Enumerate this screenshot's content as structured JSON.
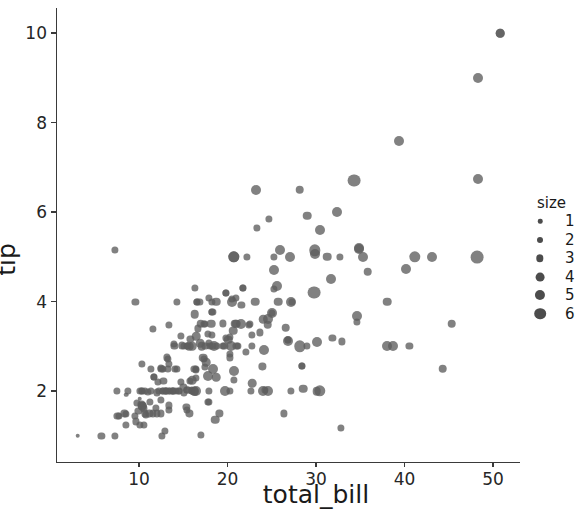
{
  "chart_data": {
    "type": "scatter",
    "title": "",
    "xlabel": "total_bill",
    "ylabel": "tip",
    "xlim": [
      2.5,
      54.0
    ],
    "ylim": [
      0.65,
      10.3
    ],
    "xticks": [
      10,
      20,
      30,
      40,
      50
    ],
    "yticks": [
      2,
      4,
      6,
      8,
      10
    ],
    "xticklabels": [
      "10",
      "20",
      "30",
      "40",
      "50"
    ],
    "yticklabels": [
      "2",
      "4",
      "6",
      "8",
      "10"
    ],
    "grid": false,
    "marker_color": "#5e5e5e",
    "marker_opacity": 0.78,
    "size_encoding": "size",
    "legend": {
      "position": "right",
      "title": "size",
      "entries": [
        {
          "label": "1",
          "diameter_px": 4.5
        },
        {
          "label": "2",
          "diameter_px": 6.0
        },
        {
          "label": "3",
          "diameter_px": 7.4
        },
        {
          "label": "4",
          "diameter_px": 8.8
        },
        {
          "label": "5",
          "diameter_px": 10.1
        },
        {
          "label": "6",
          "diameter_px": 11.6
        }
      ]
    },
    "points": [
      [
        16.99,
        1.01,
        2
      ],
      [
        10.34,
        1.66,
        3
      ],
      [
        21.01,
        3.5,
        3
      ],
      [
        23.68,
        3.31,
        2
      ],
      [
        24.59,
        3.61,
        4
      ],
      [
        25.29,
        4.71,
        4
      ],
      [
        8.77,
        2.0,
        2
      ],
      [
        26.88,
        3.12,
        4
      ],
      [
        15.04,
        1.96,
        2
      ],
      [
        14.78,
        3.23,
        2
      ],
      [
        10.27,
        1.71,
        2
      ],
      [
        35.26,
        5.0,
        4
      ],
      [
        15.42,
        1.57,
        2
      ],
      [
        18.43,
        3.0,
        4
      ],
      [
        14.83,
        3.02,
        2
      ],
      [
        21.58,
        3.92,
        2
      ],
      [
        10.33,
        1.67,
        3
      ],
      [
        16.29,
        3.71,
        3
      ],
      [
        16.97,
        3.5,
        3
      ],
      [
        20.65,
        3.35,
        3
      ],
      [
        17.92,
        4.08,
        2
      ],
      [
        20.29,
        2.75,
        2
      ],
      [
        15.77,
        2.23,
        2
      ],
      [
        39.42,
        7.58,
        4
      ],
      [
        19.82,
        3.18,
        2
      ],
      [
        17.81,
        2.34,
        4
      ],
      [
        13.37,
        2.0,
        2
      ],
      [
        12.69,
        2.0,
        2
      ],
      [
        21.7,
        4.3,
        2
      ],
      [
        19.65,
        3.0,
        2
      ],
      [
        9.55,
        1.45,
        2
      ],
      [
        18.35,
        2.5,
        4
      ],
      [
        15.06,
        3.0,
        2
      ],
      [
        20.69,
        2.45,
        4
      ],
      [
        17.78,
        3.27,
        2
      ],
      [
        24.06,
        3.6,
        3
      ],
      [
        16.31,
        2.0,
        3
      ],
      [
        16.93,
        3.07,
        3
      ],
      [
        18.69,
        2.31,
        3
      ],
      [
        31.27,
        5.0,
        3
      ],
      [
        16.04,
        2.24,
        3
      ],
      [
        17.46,
        2.54,
        2
      ],
      [
        13.94,
        3.06,
        2
      ],
      [
        9.68,
        1.32,
        2
      ],
      [
        30.4,
        5.6,
        4
      ],
      [
        18.29,
        3.0,
        2
      ],
      [
        22.23,
        5.0,
        2
      ],
      [
        32.4,
        6.0,
        4
      ],
      [
        28.55,
        2.05,
        3
      ],
      [
        18.04,
        3.0,
        2
      ],
      [
        12.54,
        2.5,
        2
      ],
      [
        10.29,
        2.6,
        2
      ],
      [
        34.81,
        5.2,
        4
      ],
      [
        9.94,
        1.56,
        2
      ],
      [
        25.56,
        4.34,
        4
      ],
      [
        19.49,
        3.51,
        2
      ],
      [
        38.01,
        3.0,
        4
      ],
      [
        26.41,
        1.5,
        2
      ],
      [
        11.24,
        1.76,
        2
      ],
      [
        48.27,
        6.73,
        4
      ],
      [
        20.29,
        3.21,
        2
      ],
      [
        13.81,
        2.0,
        2
      ],
      [
        11.02,
        1.98,
        2
      ],
      [
        18.29,
        3.76,
        2
      ],
      [
        17.59,
        2.64,
        3
      ],
      [
        20.08,
        3.15,
        3
      ],
      [
        16.45,
        2.47,
        2
      ],
      [
        3.07,
        1.0,
        1
      ],
      [
        20.23,
        2.01,
        2
      ],
      [
        15.01,
        2.09,
        2
      ],
      [
        12.02,
        1.97,
        2
      ],
      [
        17.07,
        3.0,
        3
      ],
      [
        26.86,
        3.14,
        2
      ],
      [
        25.28,
        5.0,
        2
      ],
      [
        14.73,
        2.2,
        2
      ],
      [
        10.51,
        1.25,
        2
      ],
      [
        17.92,
        3.08,
        2
      ],
      [
        27.2,
        4.0,
        4
      ],
      [
        22.76,
        3.0,
        2
      ],
      [
        17.29,
        2.71,
        2
      ],
      [
        19.44,
        3.0,
        2
      ],
      [
        16.66,
        3.4,
        2
      ],
      [
        10.07,
        1.83,
        1
      ],
      [
        32.68,
        5.0,
        2
      ],
      [
        15.98,
        2.03,
        2
      ],
      [
        34.83,
        5.17,
        4
      ],
      [
        13.03,
        2.0,
        2
      ],
      [
        18.28,
        4.0,
        2
      ],
      [
        24.71,
        5.85,
        2
      ],
      [
        21.16,
        3.0,
        2
      ],
      [
        28.97,
        3.0,
        2
      ],
      [
        22.49,
        3.5,
        2
      ],
      [
        5.75,
        1.0,
        2
      ],
      [
        16.32,
        4.3,
        2
      ],
      [
        22.75,
        3.25,
        2
      ],
      [
        40.17,
        4.73,
        4
      ],
      [
        27.28,
        4.0,
        2
      ],
      [
        12.03,
        1.5,
        2
      ],
      [
        21.01,
        3.0,
        2
      ],
      [
        12.46,
        1.5,
        2
      ],
      [
        11.35,
        2.5,
        2
      ],
      [
        15.38,
        3.0,
        2
      ],
      [
        44.3,
        2.5,
        3
      ],
      [
        22.42,
        3.48,
        2
      ],
      [
        20.92,
        4.08,
        2
      ],
      [
        15.36,
        1.64,
        2
      ],
      [
        20.49,
        4.06,
        2
      ],
      [
        25.21,
        4.29,
        2
      ],
      [
        18.24,
        3.76,
        2
      ],
      [
        14.31,
        4.0,
        2
      ],
      [
        14.0,
        3.0,
        2
      ],
      [
        7.25,
        1.0,
        2
      ],
      [
        38.07,
        4.0,
        3
      ],
      [
        23.95,
        2.55,
        2
      ],
      [
        25.71,
        4.0,
        3
      ],
      [
        17.31,
        3.5,
        2
      ],
      [
        29.93,
        5.07,
        4
      ],
      [
        10.65,
        1.5,
        2
      ],
      [
        12.43,
        1.8,
        2
      ],
      [
        24.08,
        2.92,
        4
      ],
      [
        11.69,
        2.31,
        2
      ],
      [
        13.42,
        1.68,
        2
      ],
      [
        14.26,
        2.5,
        2
      ],
      [
        15.95,
        2.0,
        2
      ],
      [
        12.48,
        2.52,
        2
      ],
      [
        29.8,
        4.2,
        6
      ],
      [
        8.52,
        1.48,
        2
      ],
      [
        14.52,
        2.0,
        2
      ],
      [
        11.38,
        2.0,
        2
      ],
      [
        22.82,
        2.18,
        3
      ],
      [
        19.08,
        1.5,
        2
      ],
      [
        20.27,
        2.83,
        2
      ],
      [
        11.17,
        1.5,
        2
      ],
      [
        12.26,
        2.0,
        2
      ],
      [
        18.26,
        3.25,
        2
      ],
      [
        8.51,
        1.25,
        2
      ],
      [
        10.33,
        2.0,
        2
      ],
      [
        14.15,
        2.0,
        2
      ],
      [
        16.0,
        2.0,
        2
      ],
      [
        13.16,
        2.75,
        2
      ],
      [
        17.47,
        3.5,
        2
      ],
      [
        34.3,
        6.7,
        6
      ],
      [
        41.19,
        5.0,
        5
      ],
      [
        27.05,
        5.0,
        4
      ],
      [
        16.43,
        2.3,
        2
      ],
      [
        8.35,
        1.5,
        2
      ],
      [
        18.64,
        1.36,
        3
      ],
      [
        11.87,
        1.63,
        2
      ],
      [
        19.81,
        4.19,
        2
      ],
      [
        28.44,
        2.56,
        2
      ],
      [
        15.48,
        2.02,
        2
      ],
      [
        16.58,
        4.0,
        2
      ],
      [
        7.56,
        1.44,
        2
      ],
      [
        10.34,
        2.0,
        2
      ],
      [
        43.11,
        5.0,
        4
      ],
      [
        13.0,
        2.0,
        2
      ],
      [
        13.51,
        2.0,
        2
      ],
      [
        18.71,
        4.0,
        3
      ],
      [
        12.74,
        2.01,
        2
      ],
      [
        13.0,
        2.0,
        2
      ],
      [
        16.4,
        2.5,
        2
      ],
      [
        20.53,
        4.0,
        4
      ],
      [
        16.47,
        3.23,
        3
      ],
      [
        26.59,
        3.41,
        3
      ],
      [
        38.73,
        3.0,
        4
      ],
      [
        24.27,
        2.03,
        2
      ],
      [
        12.76,
        2.23,
        2
      ],
      [
        30.06,
        2.0,
        3
      ],
      [
        25.89,
        5.16,
        4
      ],
      [
        48.33,
        9.0,
        4
      ],
      [
        13.27,
        2.5,
        2
      ],
      [
        28.17,
        6.5,
        3
      ],
      [
        12.9,
        1.1,
        2
      ],
      [
        28.15,
        3.0,
        5
      ],
      [
        11.59,
        1.5,
        2
      ],
      [
        7.74,
        1.44,
        2
      ],
      [
        30.14,
        3.09,
        4
      ],
      [
        12.16,
        2.2,
        2
      ],
      [
        13.42,
        3.48,
        2
      ],
      [
        8.58,
        1.92,
        1
      ],
      [
        15.98,
        3.0,
        3
      ],
      [
        13.42,
        1.58,
        2
      ],
      [
        16.27,
        2.5,
        2
      ],
      [
        10.09,
        2.0,
        2
      ],
      [
        20.45,
        3.0,
        4
      ],
      [
        13.28,
        2.72,
        2
      ],
      [
        22.12,
        2.88,
        2
      ],
      [
        24.01,
        2.0,
        4
      ],
      [
        15.69,
        3.0,
        3
      ],
      [
        11.61,
        3.39,
        2
      ],
      [
        10.77,
        1.47,
        2
      ],
      [
        15.53,
        3.0,
        2
      ],
      [
        10.07,
        1.25,
        2
      ],
      [
        12.6,
        1.0,
        2
      ],
      [
        32.83,
        1.17,
        2
      ],
      [
        35.83,
        4.67,
        3
      ],
      [
        29.03,
        5.92,
        3
      ],
      [
        27.18,
        2.0,
        2
      ],
      [
        22.67,
        2.0,
        2
      ],
      [
        17.82,
        1.75,
        2
      ],
      [
        18.78,
        3.0,
        2
      ],
      [
        20.69,
        5.0,
        5
      ],
      [
        9.78,
        1.73,
        2
      ],
      [
        14.07,
        2.5,
        2
      ],
      [
        7.51,
        2.0,
        2
      ],
      [
        26.86,
        3.14,
        2
      ],
      [
        25.0,
        3.75,
        2
      ],
      [
        21.7,
        4.3,
        2
      ],
      [
        50.81,
        10.0,
        3
      ],
      [
        17.92,
        1.75,
        2
      ],
      [
        13.81,
        2.0,
        2
      ],
      [
        11.69,
        2.31,
        2
      ],
      [
        17.26,
        2.74,
        3
      ],
      [
        24.55,
        2.0,
        4
      ],
      [
        19.77,
        2.0,
        4
      ],
      [
        29.85,
        5.14,
        5
      ],
      [
        48.17,
        5.0,
        6
      ],
      [
        25.0,
        3.75,
        4
      ],
      [
        13.39,
        2.61,
        2
      ],
      [
        16.49,
        2.0,
        4
      ],
      [
        21.5,
        3.5,
        4
      ],
      [
        12.66,
        2.5,
        2
      ],
      [
        16.21,
        2.0,
        3
      ],
      [
        13.81,
        2.0,
        2
      ],
      [
        17.51,
        3.0,
        2
      ],
      [
        24.52,
        3.48,
        3
      ],
      [
        20.76,
        2.24,
        2
      ],
      [
        31.71,
        4.5,
        4
      ],
      [
        10.59,
        1.61,
        2
      ],
      [
        10.63,
        2.0,
        2
      ],
      [
        50.81,
        10.0,
        3
      ],
      [
        15.81,
        3.16,
        2
      ],
      [
        7.25,
        5.15,
        2
      ],
      [
        31.85,
        3.18,
        2
      ],
      [
        16.82,
        4.0,
        2
      ],
      [
        32.9,
        3.11,
        2
      ],
      [
        17.89,
        2.0,
        2
      ],
      [
        14.48,
        2.0,
        2
      ],
      [
        9.6,
        4.0,
        2
      ],
      [
        34.63,
        3.55,
        2
      ],
      [
        34.65,
        3.68,
        4
      ],
      [
        23.33,
        5.65,
        2
      ],
      [
        45.35,
        3.5,
        3
      ],
      [
        23.17,
        6.5,
        4
      ],
      [
        40.55,
        3.0,
        2
      ],
      [
        20.69,
        5.0,
        5
      ],
      [
        20.9,
        3.5,
        3
      ],
      [
        30.46,
        2.0,
        5
      ],
      [
        18.15,
        3.5,
        3
      ],
      [
        23.1,
        4.0,
        3
      ],
      [
        15.69,
        1.5,
        2
      ],
      [
        19.81,
        4.19,
        2
      ],
      [
        28.44,
        2.56,
        2
      ],
      [
        15.48,
        2.02,
        2
      ],
      [
        16.58,
        4.0,
        2
      ]
    ]
  }
}
